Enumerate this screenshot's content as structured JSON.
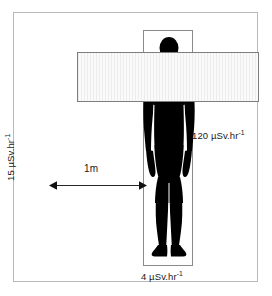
{
  "figure": {
    "name": "radiation-dose-rate-diagram"
  },
  "diagram_data": {
    "type": "diagram",
    "subject": "radiation dose rate around a shielded person",
    "elements": [
      {
        "name": "body-box",
        "shape": "rectangle",
        "role": "person enclosure"
      },
      {
        "name": "shield-bar",
        "shape": "rectangle",
        "role": "horizontal shielding barrier",
        "fill": "#f2f2f2",
        "hatch": "vertical stripes"
      },
      {
        "name": "person-silhouette",
        "shape": "human figure",
        "fill": "#000000"
      },
      {
        "name": "distance-arrow",
        "shape": "double-headed arrow",
        "role": "dimension line"
      }
    ],
    "measurements": [
      {
        "position": "at the person / behind shield",
        "value": 120,
        "unit": "uSv.hr-1",
        "display": "120 µSv.hr⁻¹"
      },
      {
        "position": "1 m to the left",
        "value": 15,
        "unit": "uSv.hr-1",
        "display": "15 µSv.hr⁻¹"
      },
      {
        "position": "below / at feet",
        "value": 4,
        "unit": "uSv.hr-1",
        "display": "4 µSv.hr⁻¹"
      }
    ],
    "distance": {
      "value": 1,
      "unit": "m",
      "display": "1m"
    }
  },
  "labels": {
    "dose_side_value": "120",
    "dose_side_unit_prefix": " µSv.hr",
    "dose_side_exp": "-1",
    "dose_side_full": "120 µSv.hr",
    "dose_bottom_full": "4 µSv.hr",
    "dose_bottom_exp": "-1",
    "dose_left_full": "15 µSv.hr",
    "dose_left_exp": "-1",
    "distance": "1m",
    "exponent": "-1"
  },
  "colors": {
    "frame_border": "#b9b9b9",
    "box_border": "#8a8a8a",
    "shield_fill": "#f2f2f2",
    "shield_border": "#7d7d7d",
    "silhouette": "#000000",
    "arrow": "#262626",
    "text": "#1a1a1a",
    "background": "#ffffff"
  }
}
